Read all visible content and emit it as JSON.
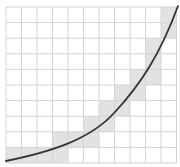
{
  "figure": {
    "colors": {
      "background": "#ffffff",
      "grid_line": "#d4d4d4",
      "shaded_cell": "#e2e2e2",
      "curve": "#333333"
    },
    "grid": {
      "x0": 6,
      "y0": 7,
      "cols": 11,
      "rows": 10,
      "cell_w": 15.5,
      "cell_h": 15.6
    },
    "shaded_cells": [
      {
        "col": 0,
        "row": 9
      },
      {
        "col": 1,
        "row": 9
      },
      {
        "col": 2,
        "row": 9
      },
      {
        "col": 3,
        "row": 9
      },
      {
        "col": 3,
        "row": 8
      },
      {
        "col": 4,
        "row": 8
      },
      {
        "col": 5,
        "row": 8
      },
      {
        "col": 5,
        "row": 7
      },
      {
        "col": 6,
        "row": 7
      },
      {
        "col": 6,
        "row": 6
      },
      {
        "col": 7,
        "row": 6
      },
      {
        "col": 7,
        "row": 5
      },
      {
        "col": 8,
        "row": 5
      },
      {
        "col": 8,
        "row": 4
      },
      {
        "col": 9,
        "row": 4
      },
      {
        "col": 9,
        "row": 3
      },
      {
        "col": 9,
        "row": 2
      },
      {
        "col": 10,
        "row": 1
      },
      {
        "col": 10,
        "row": 0
      }
    ],
    "curve_path": "M 6 161 C 50 152, 90 140, 115 112 C 140 85, 160 55, 178 6"
  }
}
